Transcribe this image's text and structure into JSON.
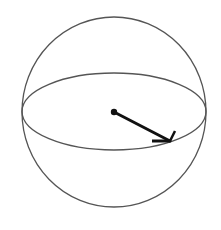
{
  "diagram": {
    "title": "",
    "colors": {
      "outline": "#555555",
      "vector": "#111111",
      "background": "#ffffff"
    },
    "sphere": {
      "cx": 114,
      "cy": 112,
      "rx": 92,
      "ry": 95
    },
    "equator": {
      "cx": 114,
      "cy": 111.5,
      "rx": 92,
      "ry": 38.5
    },
    "center_point": {
      "x": 114,
      "y": 112,
      "r": 3.2
    },
    "radius_vector": {
      "from": {
        "x": 114,
        "y": 112
      },
      "to": {
        "x": 170,
        "y": 141
      },
      "head_barb_1": {
        "x": 152,
        "y": 141
      },
      "head_barb_2": {
        "x": 175,
        "y": 131
      }
    }
  }
}
